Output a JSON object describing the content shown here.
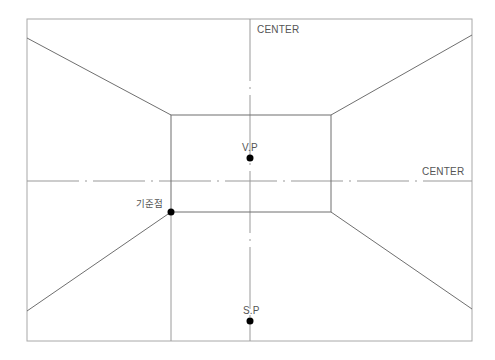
{
  "diagram": {
    "labels": {
      "center_vertical": "CENTER",
      "center_horizontal": "CENTER",
      "vanishing_point": "V.P",
      "station_point": "S.P",
      "reference_point": "기준점"
    },
    "colors": {
      "line": "#777777",
      "frame": "#aaaaaa",
      "center_line": "#999999",
      "point": "#000000",
      "text": "#555555"
    },
    "geometry": {
      "frame": {
        "x1": 27,
        "y1": 19,
        "x2": 472,
        "y2": 341
      },
      "back_wall": {
        "x1": 171,
        "y1": 115,
        "x2": 331,
        "y2": 212
      },
      "center_x": 250,
      "center_y": 181,
      "vanishing_point": {
        "x": 250,
        "y": 158
      },
      "station_point": {
        "x": 250,
        "y": 321
      },
      "reference_point": {
        "x": 171,
        "y": 212
      },
      "diagonals": [
        {
          "name": "top-left",
          "x1": 27,
          "y1": 38,
          "x2": 171,
          "y2": 115
        },
        {
          "name": "top-right",
          "x1": 472,
          "y1": 35,
          "x2": 331,
          "y2": 115
        },
        {
          "name": "bottom-left",
          "x1": 27,
          "y1": 311,
          "x2": 171,
          "y2": 212
        },
        {
          "name": "bottom-right",
          "x1": 472,
          "y1": 309,
          "x2": 331,
          "y2": 212
        }
      ]
    }
  }
}
